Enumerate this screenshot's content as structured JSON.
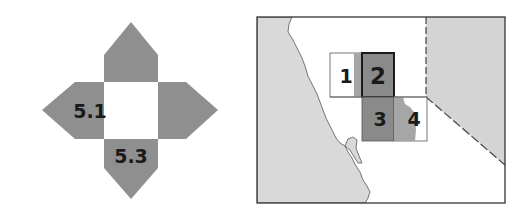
{
  "compass": {
    "labels": {
      "left": "5.1",
      "bottom": "5.3"
    },
    "colors": {
      "arm": "#8f8f8f",
      "center": "#ffffff"
    }
  },
  "map": {
    "grid_cells": [
      {
        "id": "1",
        "label": "1"
      },
      {
        "id": "2",
        "label": "2"
      },
      {
        "id": "3",
        "label": "3"
      },
      {
        "id": "4",
        "label": "4"
      }
    ],
    "colors": {
      "ocean": "#d9d9d9",
      "land": "#ffffff",
      "neighbor_state": "#d4d4d4",
      "cell_dark": "#8a8a8a",
      "cell_medium": "#a6a6a6",
      "frame": "#333333"
    }
  }
}
